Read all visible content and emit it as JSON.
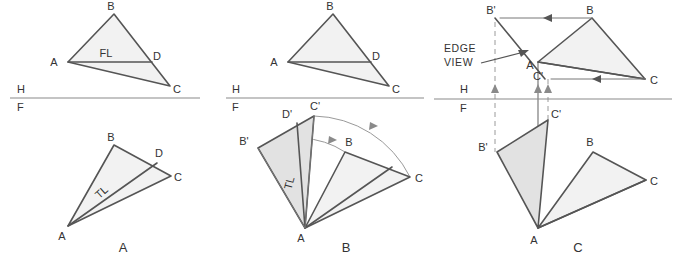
{
  "figure": {
    "background_color": "#ffffff",
    "line_color": "#555555",
    "fill_light": "#f2f2f2",
    "fill_mid": "#e2e2e2",
    "reference_line_color": "#8a8a8a"
  },
  "panels": [
    {
      "caption": "A",
      "caption_pos": {
        "x": 123,
        "y": 251
      },
      "reference_line": {
        "h_label": "H",
        "f_label": "F",
        "h_pos": {
          "x": 17,
          "y": 93
        },
        "f_pos": {
          "x": 17,
          "y": 110
        },
        "y": 98,
        "x1": 10,
        "x2": 200
      },
      "top_view": {
        "name": "horizontal-view",
        "points": {
          "A": {
            "x": 68,
            "y": 62
          },
          "B": {
            "x": 114,
            "y": 14
          },
          "C": {
            "x": 170,
            "y": 86
          },
          "D": {
            "x": 152,
            "y": 62
          }
        },
        "labels": [
          {
            "text": "A",
            "x": 54,
            "y": 66
          },
          {
            "text": "B",
            "x": 111,
            "y": 10
          },
          {
            "text": "C",
            "x": 176,
            "y": 93
          },
          {
            "text": "D",
            "x": 155,
            "y": 60
          }
        ],
        "line_label": {
          "text": "FL",
          "x": 106,
          "y": 57
        }
      },
      "front_view": {
        "name": "frontal-view",
        "points": {
          "A": {
            "x": 68,
            "y": 226
          },
          "B": {
            "x": 114,
            "y": 145
          },
          "C": {
            "x": 171,
            "y": 176
          },
          "D": {
            "x": 157,
            "y": 163
          }
        },
        "labels": [
          {
            "text": "A",
            "x": 62,
            "y": 239
          },
          {
            "text": "B",
            "x": 111,
            "y": 140
          },
          {
            "text": "C",
            "x": 177,
            "y": 180
          },
          {
            "text": "D",
            "x": 158,
            "y": 157
          }
        ],
        "line_label": {
          "text": "TL",
          "x": 104,
          "y": 195,
          "rotation": -42
        }
      }
    },
    {
      "caption": "B",
      "caption_pos": {
        "x": 346,
        "y": 251
      },
      "reference_line": {
        "h_label": "H",
        "f_label": "F",
        "h_pos": {
          "x": 232,
          "y": 93
        },
        "f_pos": {
          "x": 232,
          "y": 110
        },
        "y": 98,
        "x1": 226,
        "x2": 424
      },
      "top_view": {
        "name": "horizontal-view",
        "points": {
          "A": {
            "x": 288,
            "y": 62
          },
          "B": {
            "x": 333,
            "y": 14
          },
          "C": {
            "x": 389,
            "y": 86
          },
          "D": {
            "x": 371,
            "y": 62
          }
        },
        "labels": [
          {
            "text": "A",
            "x": 274,
            "y": 66
          },
          {
            "text": "B",
            "x": 330,
            "y": 10
          },
          {
            "text": "C",
            "x": 395,
            "y": 93
          },
          {
            "text": "D",
            "x": 374,
            "y": 60
          }
        ]
      },
      "front_view": {
        "name": "frontal-view-revolved",
        "points": {
          "A": {
            "x": 305,
            "y": 228
          },
          "B": {
            "x": 345,
            "y": 152
          },
          "C": {
            "x": 410,
            "y": 177
          },
          "D": {
            "x": 392,
            "y": 167
          },
          "Bp": {
            "x": 258,
            "y": 148
          },
          "Cp": {
            "x": 314,
            "y": 116
          },
          "Dp": {
            "x": 297,
            "y": 123
          }
        },
        "labels": [
          {
            "text": "A",
            "x": 301,
            "y": 242
          },
          {
            "text": "B",
            "x": 348,
            "y": 146
          },
          {
            "text": "C",
            "x": 418,
            "y": 181
          },
          {
            "text": "B'",
            "x": 243,
            "y": 145
          },
          {
            "text": "C'",
            "x": 314,
            "y": 110
          },
          {
            "text": "D'",
            "x": 287,
            "y": 118
          }
        ],
        "line_label": {
          "text": "TL",
          "x": 293,
          "y": 184,
          "rotation": -75
        },
        "arcs": [
          {
            "name": "arc-c-to-cprime",
            "from": "C",
            "to": "Cp"
          },
          {
            "name": "arc-b-to-bprime",
            "from": "B",
            "to": "Bp"
          }
        ]
      }
    },
    {
      "caption": "C",
      "caption_pos": {
        "x": 578,
        "y": 251
      },
      "note": {
        "line1": "EDGE",
        "line2": "VIEW",
        "x": 444,
        "y": 52
      },
      "reference_line": {
        "h_label": "H",
        "f_label": "F",
        "h_pos": {
          "x": 460,
          "y": 93
        },
        "f_pos": {
          "x": 460,
          "y": 110
        },
        "y": 99,
        "x1": 434,
        "x2": 672
      },
      "top_view": {
        "name": "horizontal-view-edge",
        "points": {
          "A": {
            "x": 538,
            "y": 62
          },
          "B": {
            "x": 592,
            "y": 18
          },
          "C": {
            "x": 645,
            "y": 79
          },
          "Bp": {
            "x": 495,
            "y": 18
          },
          "Cp": {
            "x": 545,
            "y": 79
          }
        },
        "labels": [
          {
            "text": "A",
            "x": 530,
            "y": 68
          },
          {
            "text": "B",
            "x": 589,
            "y": 14
          },
          {
            "text": "C",
            "x": 652,
            "y": 83
          },
          {
            "text": "B'",
            "x": 491,
            "y": 14
          },
          {
            "text": "C'",
            "x": 538,
            "y": 79
          }
        ],
        "move_arrows": [
          {
            "name": "arrow-b-to-bprime",
            "x1": 592,
            "x2": 500,
            "y": 18
          },
          {
            "name": "arrow-c-to-cprime",
            "x1": 645,
            "x2": 551,
            "y": 79
          }
        ]
      },
      "front_view": {
        "name": "frontal-view-edge",
        "points": {
          "A": {
            "x": 538,
            "y": 228
          },
          "B": {
            "x": 593,
            "y": 152
          },
          "C": {
            "x": 646,
            "y": 180
          },
          "Bp": {
            "x": 497,
            "y": 152
          },
          "Cp": {
            "x": 548,
            "y": 120
          }
        },
        "labels": [
          {
            "text": "A",
            "x": 534,
            "y": 243
          },
          {
            "text": "B",
            "x": 590,
            "y": 146
          },
          {
            "text": "C",
            "x": 653,
            "y": 184
          },
          {
            "text": "B'",
            "x": 482,
            "y": 150
          },
          {
            "text": "C'",
            "x": 553,
            "y": 118
          }
        ]
      },
      "projectors": [
        {
          "name": "projector-bprime",
          "x": 495,
          "y1": 22,
          "y2": 152
        },
        {
          "name": "projector-a",
          "x": 538,
          "y1": 62,
          "y2": 228
        },
        {
          "name": "projector-cprime",
          "x": 548,
          "y1": 79,
          "y2": 120
        }
      ],
      "projector_arrows": [
        {
          "name": "projector-arrow-left",
          "x": 495,
          "y": 88
        },
        {
          "name": "projector-arrow-mid",
          "x": 538,
          "y": 88
        },
        {
          "name": "projector-arrow-right",
          "x": 548,
          "y": 88
        }
      ]
    }
  ]
}
